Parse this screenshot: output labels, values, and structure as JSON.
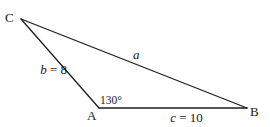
{
  "diagram": {
    "type": "triangle",
    "vertices": [
      {
        "id": "C",
        "label": "C",
        "x": 21,
        "y": 19
      },
      {
        "id": "A",
        "label": "A",
        "x": 99,
        "y": 108
      },
      {
        "id": "B",
        "label": "B",
        "x": 247,
        "y": 108
      }
    ],
    "sides": [
      {
        "id": "a",
        "from": "C",
        "to": "B",
        "var": "a",
        "value_text": ""
      },
      {
        "id": "b",
        "from": "C",
        "to": "A",
        "var": "b",
        "value_text": " = 8"
      },
      {
        "id": "c",
        "from": "A",
        "to": "B",
        "var": "c",
        "value_text": " = 10"
      }
    ],
    "angles": [
      {
        "at": "A",
        "label": "130°"
      }
    ],
    "colors": {
      "stroke": "#1e1e1e",
      "text": "#1a1a1a",
      "background": "#ffffff"
    }
  }
}
